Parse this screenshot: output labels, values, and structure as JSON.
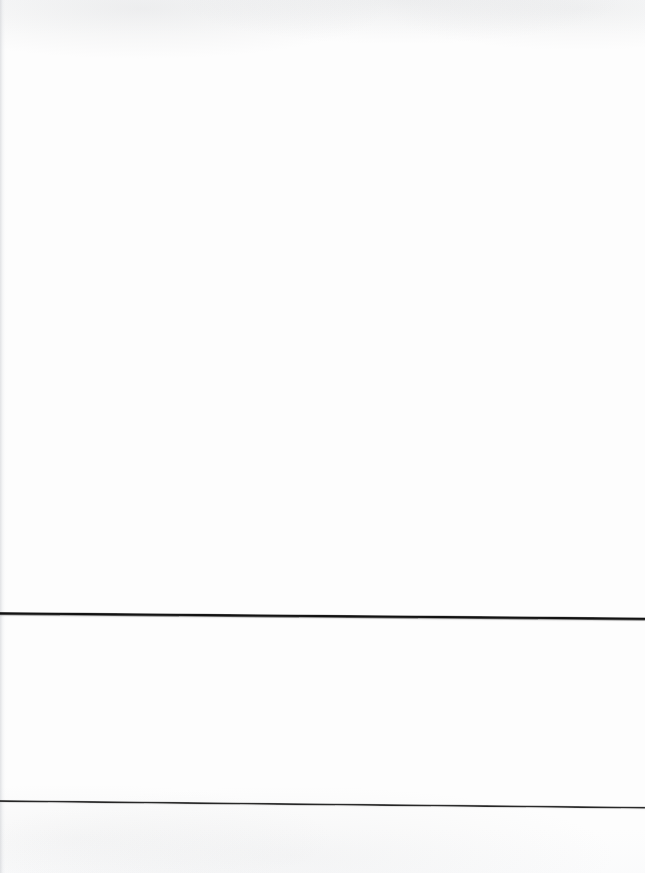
{
  "document": {
    "kind": "scanned-page",
    "page_width": 645,
    "page_height": 873,
    "paper_color": "#fdfdfd",
    "content_text": "",
    "description": "Blank scanned document page with two full-width horizontal rules in the lower portion"
  },
  "marks": {
    "rules": [
      {
        "name": "upper-rule",
        "label": "",
        "color": "#141414",
        "thickness_px": 3.4,
        "y_left_px": 612,
        "y_right_px": 617,
        "x_start_px": 0,
        "x_end_px": 645,
        "skew_degrees": 0.48,
        "weight": "thick"
      },
      {
        "name": "lower-rule",
        "label": "",
        "color": "#2c2c2c",
        "thickness_px": 1.9,
        "y_left_px": 800,
        "y_right_px": 807,
        "x_start_px": 0,
        "x_end_px": 645,
        "skew_degrees": 0.6,
        "weight": "thin"
      }
    ]
  },
  "artifacts": {
    "gutter_shadow": {
      "name": "left-edge-gutter-shadow",
      "edge": "left",
      "width_px": 7,
      "color": "#cdcfd3"
    },
    "grain": {
      "name": "paper-grain",
      "color": "#f6f7f8"
    }
  }
}
